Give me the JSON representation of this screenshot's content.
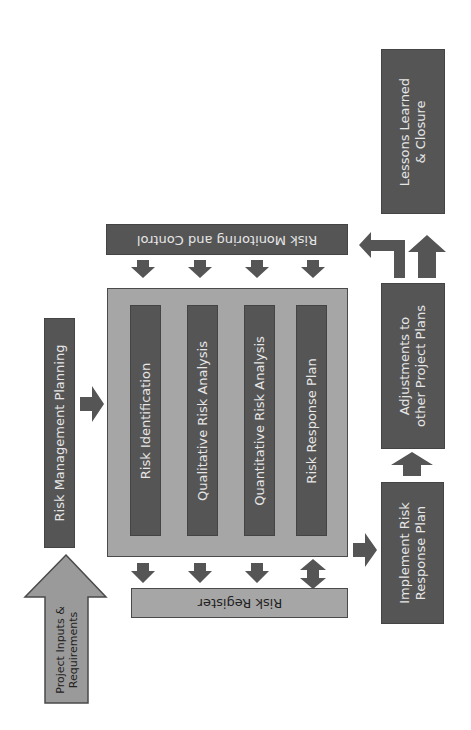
{
  "diagram": {
    "colors": {
      "dark_box": "#555555",
      "light_box": "#a6a6a6",
      "arrow": "#555555",
      "input_arrow": "#9a9a9a",
      "text_on_dark": "#e6e6e6",
      "text_on_light": "#222222"
    },
    "input": {
      "label_line1": "Project Inputs &",
      "label_line2": "Requirements"
    },
    "planning": {
      "label": "Risk Management Planning"
    },
    "monitoring": {
      "label": "Risk Monitoring and Control"
    },
    "core_process": {
      "steps": [
        {
          "label": "Risk Identification"
        },
        {
          "label": "Qualitative Risk Analysis"
        },
        {
          "label": "Quantitative Risk Analysis"
        },
        {
          "label": "Risk Response Plan"
        }
      ]
    },
    "register": {
      "label": "Risk Register"
    },
    "implement": {
      "label_line1": "Implement Risk",
      "label_line2": "Response Plan"
    },
    "adjustments": {
      "label_line1": "Adjustments to",
      "label_line2": "other Project Plans"
    },
    "lessons": {
      "label_line1": "Lessons Learned",
      "label_line2": "& Closure"
    }
  }
}
